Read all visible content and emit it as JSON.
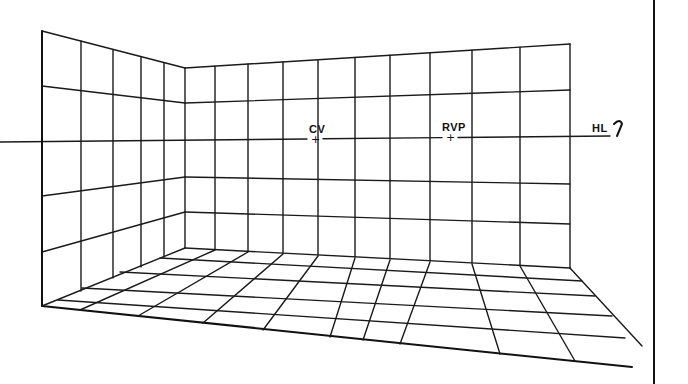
{
  "diagram": {
    "labels": {
      "cv": "CV",
      "rvp": "RVP",
      "hl": "HL"
    },
    "marker_glyph": "+",
    "colors": {
      "line": "#1a1a1a",
      "background": "#ffffff"
    },
    "horizon": {
      "x1": 0,
      "y1": 142,
      "x2": 610,
      "y2": 136
    },
    "frame_right_x": 654,
    "left_wall": {
      "near_edge": {
        "x": 42,
        "top": 31,
        "bottom": 306
      },
      "far_edge": {
        "x": 185,
        "top": 68,
        "bottom": 248
      },
      "verticals": [
        {
          "x": 81,
          "top": 41,
          "bottom": 291
        },
        {
          "x": 113,
          "top": 50,
          "bottom": 278
        },
        {
          "x": 141,
          "top": 57,
          "bottom": 267
        },
        {
          "x": 164,
          "top": 63,
          "bottom": 257
        }
      ],
      "horizontals": [
        {
          "y_near": 86,
          "y_far": 103
        },
        {
          "y_near": 196,
          "y_far": 177
        },
        {
          "y_near": 252,
          "y_far": 212
        }
      ]
    },
    "back_wall": {
      "top": {
        "x1": 185,
        "y1": 68,
        "x2": 570,
        "y2": 44
      },
      "bottom": {
        "x1": 185,
        "y1": 248,
        "x2": 570,
        "y2": 268
      },
      "verticals_x": [
        215,
        248,
        283,
        318,
        355,
        390,
        430,
        472,
        520,
        570
      ],
      "horizontals": [
        {
          "y_left": 103,
          "y_right": 90
        },
        {
          "y_left": 177,
          "y_right": 184
        },
        {
          "y_left": 212,
          "y_right": 224
        }
      ]
    },
    "floor": {
      "front_edge": {
        "x1": 42,
        "y1": 306,
        "x2": 632,
        "y2": 367
      },
      "right_edge": {
        "x1": 570,
        "y1": 268,
        "x2": 642,
        "y2": 346
      },
      "depth_lines": [
        {
          "x1": 215,
          "y1": 250,
          "x2": 80,
          "y2": 310
        },
        {
          "x1": 248,
          "y1": 252,
          "x2": 138,
          "y2": 316
        },
        {
          "x1": 283,
          "y1": 254,
          "x2": 203,
          "y2": 323
        },
        {
          "x1": 318,
          "y1": 256,
          "x2": 263,
          "y2": 330
        },
        {
          "x1": 355,
          "y1": 258,
          "x2": 330,
          "y2": 337
        },
        {
          "x1": 390,
          "y1": 260,
          "x2": 363,
          "y2": 340
        },
        {
          "x1": 430,
          "y1": 262,
          "x2": 400,
          "y2": 344
        },
        {
          "x1": 472,
          "y1": 264,
          "x2": 500,
          "y2": 354
        },
        {
          "x1": 520,
          "y1": 266,
          "x2": 575,
          "y2": 361
        }
      ],
      "cross_lines": [
        {
          "x1": 160,
          "y1": 258,
          "x2": 582,
          "y2": 281
        },
        {
          "x1": 120,
          "y1": 272,
          "x2": 595,
          "y2": 296
        },
        {
          "x1": 82,
          "y1": 288,
          "x2": 612,
          "y2": 316
        },
        {
          "x1": 58,
          "y1": 300,
          "x2": 625,
          "y2": 338
        }
      ]
    },
    "markers": {
      "cv": {
        "x": 315,
        "y": 140
      },
      "rvp": {
        "x": 450,
        "y": 138
      },
      "hl_label": {
        "x": 592,
        "y": 122
      }
    }
  }
}
